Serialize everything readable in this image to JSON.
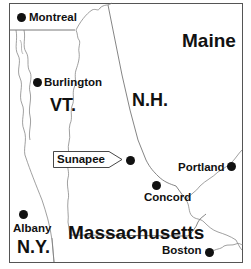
{
  "map": {
    "states": [
      {
        "id": "vt",
        "label": "VT."
      },
      {
        "id": "nh",
        "label": "N.H."
      },
      {
        "id": "maine",
        "label": "Maine"
      },
      {
        "id": "ny",
        "label": "N.Y."
      },
      {
        "id": "ma",
        "label": "Massachusetts"
      }
    ],
    "cities": [
      {
        "id": "montreal",
        "label": "Montreal"
      },
      {
        "id": "burlington",
        "label": "Burlington"
      },
      {
        "id": "sunapee",
        "label": "Sunapee"
      },
      {
        "id": "portland",
        "label": "Portland"
      },
      {
        "id": "concord",
        "label": "Concord"
      },
      {
        "id": "albany",
        "label": "Albany"
      },
      {
        "id": "boston",
        "label": "Boston"
      }
    ],
    "highlight": {
      "label": "Sunapee",
      "marker": "arrow-callout"
    },
    "colors": {
      "background": "#ffffff",
      "border": "#555555",
      "text": "#111111"
    }
  }
}
